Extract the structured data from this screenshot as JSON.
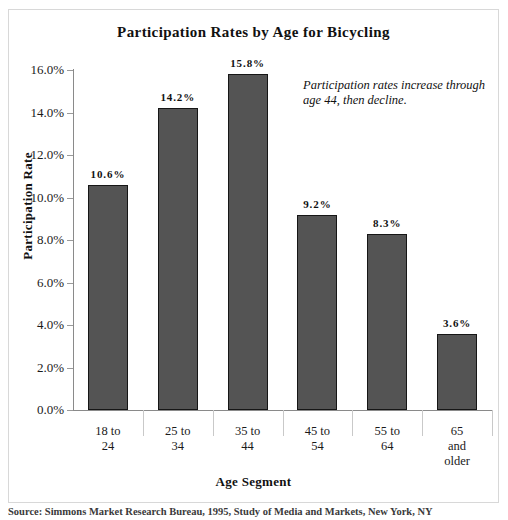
{
  "chart_data": {
    "type": "bar",
    "title": "Participation Rates by Age for Bicycling",
    "xlabel": "Age Segment",
    "ylabel": "Participation Rate",
    "categories": [
      "18 to 24",
      "25 to 34",
      "35 to 44",
      "45 to 54",
      "55 to 64",
      "65 and older"
    ],
    "category_lines": [
      [
        "18 to",
        "24"
      ],
      [
        "25 to",
        "34"
      ],
      [
        "35 to",
        "44"
      ],
      [
        "45 to",
        "54"
      ],
      [
        "55 to",
        "64"
      ],
      [
        "65",
        "and",
        "older"
      ]
    ],
    "values": [
      10.6,
      14.2,
      15.8,
      9.2,
      8.3,
      3.6
    ],
    "value_labels": [
      "10.6%",
      "14.2%",
      "15.8%",
      "9.2%",
      "8.3%",
      "3.6%"
    ],
    "ylim": [
      0,
      16
    ],
    "ytick_values": [
      0,
      2,
      4,
      6,
      8,
      10,
      12,
      14,
      16
    ],
    "ytick_labels": [
      "0.0%",
      "2.0%",
      "4.0%",
      "6.0%",
      "8.0%",
      "10.0%",
      "12.0%",
      "14.0%",
      "16.0%"
    ],
    "grid": false,
    "legend": "none",
    "annotation": "Participation rates increase through age 44, then decline.",
    "bar_color": "#545454",
    "bar_border_color": "#161616",
    "axis_color": "#8a8a8a",
    "text_color": "#111111"
  },
  "source_note": "Source: Simmons Market Research Bureau, 1995, Study of Media and Markets, New York, NY"
}
